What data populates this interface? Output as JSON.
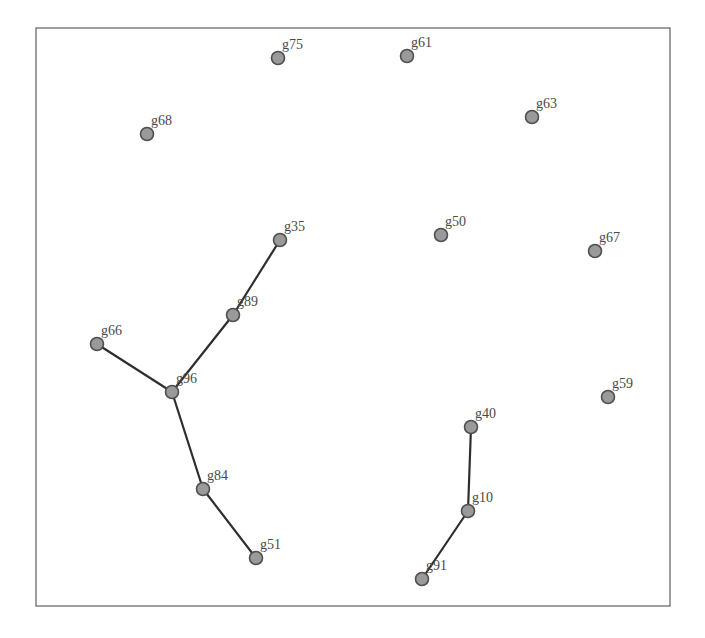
{
  "diagram": {
    "type": "graph",
    "frame": {
      "x": 36,
      "y": 28,
      "width": 634,
      "height": 578
    },
    "colors": {
      "node_fill": "#9a9a9a",
      "node_stroke": "#4f4f4f",
      "edge": "#2e2e2e",
      "label": "#4a4a4a",
      "frame": "#6b6b6b"
    },
    "nodes": [
      {
        "id": "g75",
        "label": "g75",
        "x": 278,
        "y": 58
      },
      {
        "id": "g61",
        "label": "g61",
        "x": 407,
        "y": 56
      },
      {
        "id": "g68",
        "label": "g68",
        "x": 147,
        "y": 134
      },
      {
        "id": "g63",
        "label": "g63",
        "x": 532,
        "y": 117
      },
      {
        "id": "g35",
        "label": "g35",
        "x": 280,
        "y": 240
      },
      {
        "id": "g50",
        "label": "g50",
        "x": 441,
        "y": 235
      },
      {
        "id": "g67",
        "label": "g67",
        "x": 595,
        "y": 251
      },
      {
        "id": "g89",
        "label": "g89",
        "x": 233,
        "y": 315
      },
      {
        "id": "g66",
        "label": "g66",
        "x": 97,
        "y": 344
      },
      {
        "id": "g96",
        "label": "g96",
        "x": 172,
        "y": 392
      },
      {
        "id": "g59",
        "label": "g59",
        "x": 608,
        "y": 397
      },
      {
        "id": "g40",
        "label": "g40",
        "x": 471,
        "y": 427
      },
      {
        "id": "g84",
        "label": "g84",
        "x": 203,
        "y": 489
      },
      {
        "id": "g10",
        "label": "g10",
        "x": 468,
        "y": 511
      },
      {
        "id": "g51",
        "label": "g51",
        "x": 256,
        "y": 558
      },
      {
        "id": "g91",
        "label": "g91",
        "x": 422,
        "y": 579
      }
    ],
    "edges": [
      {
        "source": "g35",
        "target": "g89"
      },
      {
        "source": "g89",
        "target": "g96"
      },
      {
        "source": "g66",
        "target": "g96"
      },
      {
        "source": "g96",
        "target": "g84"
      },
      {
        "source": "g84",
        "target": "g51"
      },
      {
        "source": "g40",
        "target": "g10"
      },
      {
        "source": "g10",
        "target": "g91"
      }
    ]
  }
}
